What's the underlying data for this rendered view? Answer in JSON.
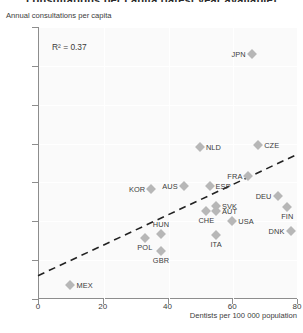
{
  "figure": {
    "clipped_title": "consultations per capita (latest year available)",
    "y_axis_title": "Annual consultations per capita",
    "x_axis_title": "Dentists per 100 000 population",
    "annotation": "R² = 0.37",
    "marker_color": "#b7b7b7",
    "axis_color": "#8d8d8d",
    "plot_bg": "#fafafa"
  },
  "chart_data": {
    "type": "scatter",
    "title": "",
    "xlabel": "Dentists per 100 000 population",
    "ylabel": "Annual consultations per capita",
    "xlim": [
      0,
      80
    ],
    "ylim": [
      0,
      3.5
    ],
    "xticks": [
      0,
      20,
      40,
      60,
      80
    ],
    "yticks": [
      "0",
      "0.5",
      "1.0",
      "1.5",
      "2.0",
      "2.5",
      "3.0",
      "3.5"
    ],
    "grid": true,
    "legend": "none",
    "annotations": [
      "R² = 0.37"
    ],
    "points": [
      {
        "label": "MEX",
        "x": 10,
        "y": 0.18,
        "label_pos": "right"
      },
      {
        "label": "POL",
        "x": 33,
        "y": 0.78,
        "label_pos": "below"
      },
      {
        "label": "HUN",
        "x": 38,
        "y": 0.83,
        "label_pos": "above"
      },
      {
        "label": "GBR",
        "x": 38,
        "y": 0.62,
        "label_pos": "below"
      },
      {
        "label": "KOR",
        "x": 35,
        "y": 1.42,
        "label_pos": "left"
      },
      {
        "label": "AUS",
        "x": 45,
        "y": 1.45,
        "label_pos": "left"
      },
      {
        "label": "NLD",
        "x": 50,
        "y": 1.95,
        "label_pos": "right"
      },
      {
        "label": "ESP",
        "x": 53,
        "y": 1.45,
        "label_pos": "right"
      },
      {
        "label": "CHE",
        "x": 52,
        "y": 1.13,
        "label_pos": "below"
      },
      {
        "label": "SVK",
        "x": 55,
        "y": 1.2,
        "label_pos": "right"
      },
      {
        "label": "AUT",
        "x": 55,
        "y": 1.13,
        "label_pos": "right"
      },
      {
        "label": "ITA",
        "x": 55,
        "y": 0.82,
        "label_pos": "below"
      },
      {
        "label": "USA",
        "x": 60,
        "y": 1.0,
        "label_pos": "right"
      },
      {
        "label": "FRA",
        "x": 65,
        "y": 1.58,
        "label_pos": "left"
      },
      {
        "label": "CZE",
        "x": 68,
        "y": 1.98,
        "label_pos": "right"
      },
      {
        "label": "JPN",
        "x": 66,
        "y": 3.15,
        "label_pos": "left"
      },
      {
        "label": "DEU",
        "x": 74,
        "y": 1.32,
        "label_pos": "left"
      },
      {
        "label": "FIN",
        "x": 77,
        "y": 1.18,
        "label_pos": "below"
      },
      {
        "label": "DNK",
        "x": 78,
        "y": 0.88,
        "label_pos": "left"
      }
    ],
    "trendline": {
      "x0": 0,
      "y0": 0.3,
      "x1": 80,
      "y1": 1.86,
      "style": "dashed",
      "color": "#222222"
    }
  }
}
